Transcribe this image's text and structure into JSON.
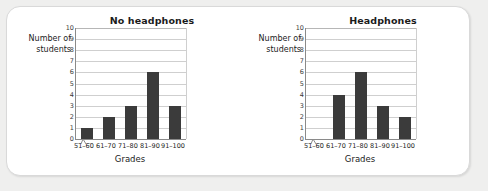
{
  "figure": {
    "background_color": "#efefee",
    "panel_color": "#ffffff",
    "bar_color": "#3b3b3b",
    "grid_color": "#cfcfcf",
    "axis_color": "#8a8a8a"
  },
  "chart_data": [
    {
      "type": "bar",
      "id": "no-headphones",
      "title": "No headphones",
      "xlabel": "Grades",
      "ylabel": "Number of\nstudents",
      "ylabel_line1": "Number of",
      "ylabel_line2": "students",
      "categories": [
        "51–60",
        "61–70",
        "71–80",
        "81–90",
        "91–100"
      ],
      "values": [
        1,
        2,
        3,
        6,
        3
      ],
      "ylim": [
        0,
        10
      ],
      "yticks": [
        10,
        9,
        8,
        7,
        6,
        5,
        4,
        3,
        2,
        1,
        0
      ],
      "grid": true,
      "legend": null,
      "axis_break": "x-axis-break-zigzag"
    },
    {
      "type": "bar",
      "id": "headphones",
      "title": "Headphones",
      "xlabel": "Grades",
      "ylabel": "Number of\nstudents",
      "ylabel_line1": "Number of",
      "ylabel_line2": "students",
      "categories": [
        "51–60",
        "61–70",
        "71–80",
        "81–90",
        "91–100"
      ],
      "values": [
        0,
        4,
        6,
        3,
        2
      ],
      "ylim": [
        0,
        10
      ],
      "yticks": [
        10,
        9,
        8,
        7,
        6,
        5,
        4,
        3,
        2,
        1,
        0
      ],
      "grid": true,
      "legend": null,
      "axis_break": "x-axis-break-zigzag"
    }
  ]
}
